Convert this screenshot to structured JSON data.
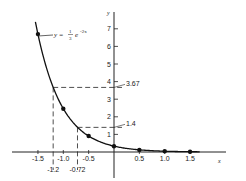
{
  "chart_data": {
    "type": "line",
    "title": "",
    "xlabel": "x",
    "ylabel": "y",
    "xlim": [
      -1.6,
      2.1
    ],
    "ylim": [
      -1.2,
      8.0
    ],
    "grid": false,
    "equation_label": {
      "prefix": "y =",
      "num": "1",
      "den": "3",
      "base": "e",
      "exponent": "-2x"
    },
    "x_ticks": [
      {
        "value": -1.5,
        "label": "-1.5"
      },
      {
        "value": -1.0,
        "label": "-1.0"
      },
      {
        "value": -0.5,
        "label": "-0.5"
      },
      {
        "value": 0.5,
        "label": "0.5"
      },
      {
        "value": 1.0,
        "label": "1.0"
      },
      {
        "value": 1.5,
        "label": "1.5"
      }
    ],
    "y_ticks": [
      {
        "value": 1,
        "label": "1"
      },
      {
        "value": 2,
        "label": "2"
      },
      {
        "value": 3,
        "label": "3"
      },
      {
        "value": 4,
        "label": "4"
      },
      {
        "value": 5,
        "label": "5"
      },
      {
        "value": 6,
        "label": "6"
      },
      {
        "value": 7,
        "label": "7"
      }
    ],
    "series": [
      {
        "name": "y = (1/3)e^(-2x)",
        "x": [
          -1.5,
          -1.0,
          -0.5,
          0.0,
          0.5,
          1.0,
          1.5
        ],
        "y": [
          6.7,
          2.46,
          0.91,
          0.33,
          0.12,
          0.045,
          0.017
        ]
      }
    ],
    "annotations": [
      {
        "type": "dashed-guide",
        "x": -1.2,
        "y": 3.67,
        "x_label": "-1.2",
        "y_label": "3.67"
      },
      {
        "type": "dashed-guide",
        "x": -0.72,
        "y": 1.4,
        "x_label": "-0.72",
        "y_label": "1.4"
      }
    ]
  }
}
